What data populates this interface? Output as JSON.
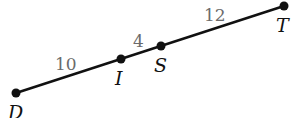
{
  "diagram": {
    "type": "line-segment",
    "points": [
      {
        "label": "D",
        "x": 16,
        "y": 93,
        "lx": 8,
        "ly": 119
      },
      {
        "label": "I",
        "x": 121,
        "y": 59,
        "lx": 115,
        "ly": 85
      },
      {
        "label": "S",
        "x": 161,
        "y": 46,
        "lx": 154,
        "ly": 72
      },
      {
        "label": "T",
        "x": 284,
        "y": 6,
        "lx": 276,
        "ly": 32
      }
    ],
    "segments": [
      {
        "from": "D",
        "to": "I",
        "length": "10",
        "lx": 55,
        "ly": 70
      },
      {
        "from": "I",
        "to": "S",
        "length": "4",
        "lx": 133,
        "ly": 47
      },
      {
        "from": "S",
        "to": "T",
        "length": "12",
        "lx": 204,
        "ly": 21
      }
    ],
    "colors": {
      "line": "#111111",
      "point": "#111111",
      "length_label": "#6b6b6b"
    }
  }
}
